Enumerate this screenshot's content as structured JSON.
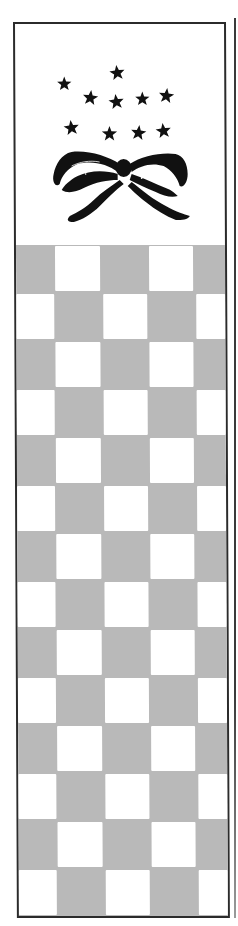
{
  "illustration": {
    "type": "decorative bookmark",
    "frame": {
      "border_color": "#2b2b2b",
      "background_color": "#ffffff"
    },
    "header": {
      "motif": "stars-and-ribbon-bow",
      "ink_color": "#111111",
      "star_count": 10,
      "stars": [
        {
          "x": 102,
          "y": 49,
          "r": 8
        },
        {
          "x": 49,
          "y": 60,
          "r": 7.5
        },
        {
          "x": 75,
          "y": 74,
          "r": 8
        },
        {
          "x": 101,
          "y": 78,
          "r": 8
        },
        {
          "x": 127,
          "y": 75,
          "r": 7.5
        },
        {
          "x": 151,
          "y": 72,
          "r": 8
        },
        {
          "x": 56,
          "y": 104,
          "r": 8
        },
        {
          "x": 94,
          "y": 110,
          "r": 8
        },
        {
          "x": 123,
          "y": 109,
          "r": 8
        },
        {
          "x": 148,
          "y": 107,
          "r": 8
        }
      ],
      "bow": {
        "knot_x": 108,
        "knot_y": 144
      }
    },
    "checkerboard": {
      "gray_color": "#b9b9b9",
      "white_color": "#ffffff",
      "rows": 14,
      "row_height": 48,
      "column_edges_odd_rows": [
        [
          39,
          84
        ],
        [
          133,
          177
        ]
      ],
      "column_edges_even_rows": [
        [
          0,
          38
        ],
        [
          87,
          131
        ],
        [
          180,
          209
        ]
      ]
    }
  }
}
